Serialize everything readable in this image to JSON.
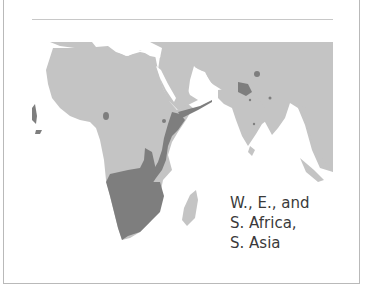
{
  "figure": {
    "caption_lines": [
      "W., E., and",
      "S. Africa,",
      "S. Asia"
    ],
    "caption": "W., E., and\nS. Africa,\nS. Asia"
  },
  "map": {
    "region": "Africa, Middle East and South Asia",
    "colors": {
      "land": "#c4c4c4",
      "range": "#7e7e7e",
      "water": "#ffffff",
      "border": "#b9b9b9",
      "rule": "#c8c8c8",
      "text": "#3a3a3a"
    },
    "highlighted_areas": [
      "West Africa coast",
      "East Africa rift",
      "Southern Africa",
      "South Asia (India/Nepal)"
    ]
  }
}
